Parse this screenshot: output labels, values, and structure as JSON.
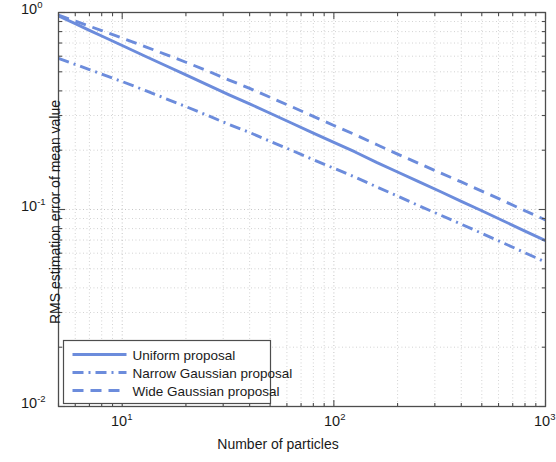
{
  "chart_data": {
    "type": "line",
    "title": "",
    "subtitle": "",
    "xlabel": "Number of particles",
    "ylabel": "RMS estimation error of mean value",
    "xscale": "log",
    "yscale": "log",
    "xlim": [
      5,
      1000
    ],
    "ylim": [
      0.01,
      1
    ],
    "grid": true,
    "grid_style": "dotted",
    "grid_minor": true,
    "legend_position": "lower left",
    "xticks": [
      10,
      100,
      1000
    ],
    "xtick_labels": [
      "10",
      "10",
      "10"
    ],
    "xtick_exponents": [
      "1",
      "2",
      "3"
    ],
    "yticks": [
      0.01,
      0.1,
      1
    ],
    "ytick_labels": [
      "10",
      "10",
      "10"
    ],
    "ytick_exponents": [
      "-2",
      "-1",
      "0"
    ],
    "line_color": "#6c8cdc",
    "series": [
      {
        "name": "Uniform proposal",
        "style": "solid",
        "color": "#6c8cdc",
        "x": [
          5,
          6,
          7,
          8,
          10,
          13,
          16,
          20,
          25,
          32,
          40,
          50,
          63,
          80,
          100,
          126,
          160,
          200,
          250,
          320,
          400,
          500,
          630,
          800,
          1000
        ],
        "y": [
          0.96,
          0.878,
          0.812,
          0.76,
          0.68,
          0.596,
          0.538,
          0.482,
          0.432,
          0.382,
          0.344,
          0.308,
          0.275,
          0.244,
          0.219,
          0.196,
          0.173,
          0.155,
          0.139,
          0.123,
          0.11,
          0.0985,
          0.0877,
          0.0777,
          0.0695
        ]
      },
      {
        "name": "Narrow Gaussian proposal",
        "style": "dashdot",
        "color": "#6c8cdc",
        "x": [
          5,
          6,
          7,
          8,
          10,
          13,
          16,
          20,
          25,
          32,
          40,
          50,
          63,
          80,
          100,
          126,
          160,
          200,
          250,
          320,
          400,
          500,
          630,
          800,
          1000
        ],
        "y": [
          0.585,
          0.545,
          0.513,
          0.487,
          0.446,
          0.4,
          0.366,
          0.333,
          0.302,
          0.27,
          0.246,
          0.222,
          0.2,
          0.179,
          0.162,
          0.146,
          0.13,
          0.117,
          0.105,
          0.0935,
          0.0842,
          0.0757,
          0.0677,
          0.0603,
          0.0541
        ]
      },
      {
        "name": "Wide Gaussian proposal",
        "style": "dashed",
        "color": "#6c8cdc",
        "x": [
          5,
          6,
          7,
          8,
          10,
          13,
          16,
          20,
          25,
          32,
          40,
          50,
          63,
          80,
          100,
          126,
          160,
          200,
          250,
          320,
          400,
          500,
          630,
          800,
          1000
        ],
        "y": [
          0.97,
          0.905,
          0.852,
          0.81,
          0.742,
          0.668,
          0.613,
          0.559,
          0.508,
          0.454,
          0.412,
          0.371,
          0.333,
          0.297,
          0.267,
          0.24,
          0.213,
          0.191,
          0.172,
          0.153,
          0.138,
          0.124,
          0.111,
          0.0985,
          0.0885
        ]
      }
    ]
  },
  "legend": {
    "items": [
      {
        "label": "Uniform proposal",
        "style": "solid"
      },
      {
        "label": "Narrow Gaussian proposal",
        "style": "dashdot"
      },
      {
        "label": "Wide Gaussian proposal",
        "style": "dashed"
      }
    ]
  },
  "axes": {
    "x_title": "Number of particles",
    "y_title": "RMS estimation error of mean value",
    "x_tick_0_mantissa": "10",
    "x_tick_0_exp": "1",
    "x_tick_1_mantissa": "10",
    "x_tick_1_exp": "2",
    "x_tick_2_mantissa": "10",
    "x_tick_2_exp": "3",
    "y_tick_0_mantissa": "10",
    "y_tick_0_exp": "0",
    "y_tick_1_mantissa": "10",
    "y_tick_1_exp": "-1",
    "y_tick_2_mantissa": "10",
    "y_tick_2_exp": "-2"
  },
  "style": {
    "line_color": "#6c8cdc",
    "axis_color": "#4d4d4d",
    "grid_color": "#b4b4b4",
    "text_color": "#1a1a1a",
    "background": "#ffffff"
  }
}
